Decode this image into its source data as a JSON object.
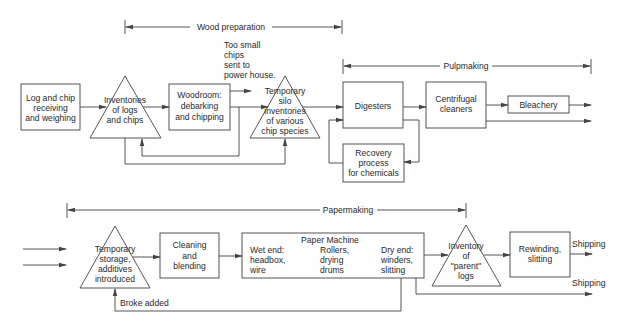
{
  "phases": {
    "wood_preparation": "Wood preparation",
    "pulpmaking": "Pulpmaking",
    "papermaking": "Papermaking"
  },
  "nodes": {
    "log_receiving": [
      "Log and chip",
      "receiving",
      "and weighing"
    ],
    "inventories_logs": [
      "Inventories",
      "of logs",
      "and chips"
    ],
    "woodroom": [
      "Woodroom:",
      "debarking",
      "and chipping"
    ],
    "small_chips_note": [
      "Too small",
      "chips",
      "sent to",
      "power house."
    ],
    "temp_silo": [
      "Temporary",
      "silo",
      "inventories",
      "of various",
      "chip species"
    ],
    "digesters": [
      "Digesters"
    ],
    "centrifugal": [
      "Centrifugal",
      "cleaners"
    ],
    "bleachery": [
      "Bleachery"
    ],
    "recovery": [
      "Recovery",
      "process",
      "for chemicals"
    ],
    "temp_storage": [
      "Temporary",
      "storage,",
      "additives",
      "introduced"
    ],
    "cleaning": [
      "Cleaning",
      "and",
      "blending"
    ],
    "paper_machine": {
      "title": "Paper Machine",
      "wet_end": [
        "Wet end:",
        "headbox,",
        "wire"
      ],
      "rollers": [
        "Rollers,",
        "drying",
        "drums"
      ],
      "dry_end": [
        "Dry end:",
        "winders,",
        "slitting"
      ]
    },
    "inventory_parent": [
      "Inventory",
      "of",
      "\"parent\"",
      "logs"
    ],
    "rewinding": [
      "Rewinding,",
      "slitting"
    ]
  },
  "labels": {
    "broke_added": "Broke added",
    "shipping_1": "Shipping",
    "shipping_2": "Shipping"
  }
}
